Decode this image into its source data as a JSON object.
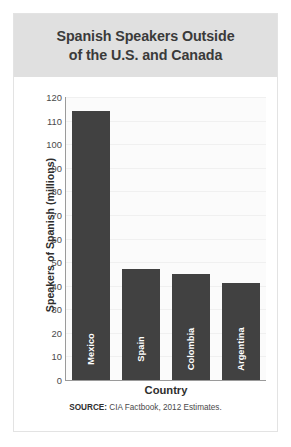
{
  "chart_data": {
    "type": "bar",
    "title": "Spanish Speakers Outside\nof the U.S. and Canada",
    "categories": [
      "Mexico",
      "Spain",
      "Colombia",
      "Argentina"
    ],
    "values": [
      114,
      47,
      45,
      41
    ],
    "xlabel": "Country",
    "ylabel": "Speakers of Spanish (millions)",
    "ylim": [
      0,
      120
    ],
    "ytick_step": 10,
    "yticks": [
      "120",
      "110",
      "100",
      "90",
      "80",
      "70",
      "60",
      "50",
      "40",
      "30",
      "20",
      "10",
      "0"
    ],
    "grid": true,
    "legend": null,
    "bar_color": "#414141",
    "title_band_color": "#e0e0e0",
    "plot_background": "#fbfbfb",
    "source_prefix": "SOURCE:",
    "source_text": "CIA Factbook, 2012 Estimates."
  }
}
